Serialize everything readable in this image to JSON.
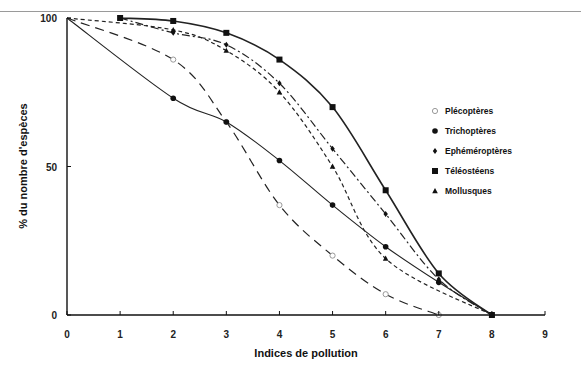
{
  "chart_data": {
    "type": "line",
    "title": "",
    "xlabel": "Indices de pollution",
    "ylabel": "% du nombre d'espèces",
    "xlim": [
      0,
      9
    ],
    "ylim": [
      0,
      100
    ],
    "x_ticks": [
      "0",
      "1",
      "2",
      "3",
      "4",
      "5",
      "6",
      "7",
      "8",
      "9"
    ],
    "y_ticks": [
      "0",
      "50",
      "100"
    ],
    "grid": false,
    "legend_position": "right-inside",
    "series": [
      {
        "name": "Plécoptères",
        "marker": "open-circle",
        "line": "long-dash",
        "points": [
          [
            0,
            100
          ],
          [
            2,
            86
          ],
          [
            3,
            65
          ],
          [
            4,
            37
          ],
          [
            5,
            20
          ],
          [
            6,
            7
          ],
          [
            7,
            0
          ]
        ]
      },
      {
        "name": "Trichoptères",
        "marker": "filled-circle",
        "line": "solid",
        "points": [
          [
            0,
            100
          ],
          [
            2,
            73
          ],
          [
            3,
            65
          ],
          [
            4,
            52
          ],
          [
            5,
            37
          ],
          [
            6,
            23
          ],
          [
            7,
            11
          ],
          [
            8,
            0
          ]
        ]
      },
      {
        "name": "Ephéméroptères",
        "marker": "diamond",
        "line": "dash-dot",
        "points": [
          [
            1,
            100
          ],
          [
            2,
            95
          ],
          [
            3,
            91
          ],
          [
            4,
            78
          ],
          [
            5,
            56
          ],
          [
            6,
            34
          ],
          [
            7,
            12
          ],
          [
            8,
            0
          ]
        ]
      },
      {
        "name": "Téléostéens",
        "marker": "filled-square",
        "line": "solid",
        "points": [
          [
            1,
            100
          ],
          [
            2,
            99
          ],
          [
            3,
            95
          ],
          [
            4,
            86
          ],
          [
            5,
            70
          ],
          [
            6,
            42
          ],
          [
            7,
            14
          ],
          [
            8,
            0
          ]
        ]
      },
      {
        "name": "Mollusques",
        "marker": "filled-triangle",
        "line": "short-dash",
        "points": [
          [
            0,
            100
          ],
          [
            2,
            96
          ],
          [
            3,
            89
          ],
          [
            4,
            75
          ],
          [
            5,
            50
          ],
          [
            6,
            19
          ],
          [
            8,
            0
          ]
        ]
      }
    ]
  },
  "axes": {
    "xlabel": "Indices de pollution",
    "ylabel": "% du nombre d'espèces"
  },
  "legend": [
    {
      "label": "Plécoptères",
      "icon": "open-circle-icon"
    },
    {
      "label": "Trichoptères",
      "icon": "filled-circle-icon"
    },
    {
      "label": "Ephéméroptères",
      "icon": "diamond-icon"
    },
    {
      "label": "Téléostéens",
      "icon": "filled-square-icon"
    },
    {
      "label": "Mollusques",
      "icon": "triangle-icon"
    }
  ]
}
